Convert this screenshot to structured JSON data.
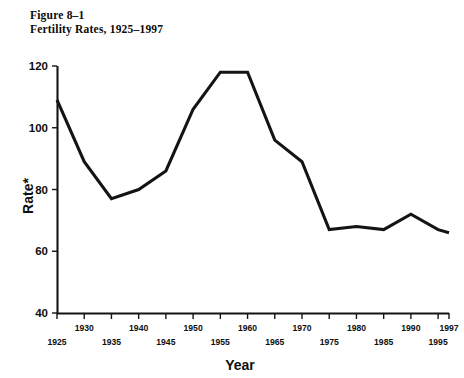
{
  "figure": {
    "label": "Figure 8–1",
    "caption": "Fertility Rates, 1925–1997"
  },
  "chart_data": {
    "type": "line",
    "title": "Fertility Rates, 1925–1997",
    "xlabel": "Year",
    "ylabel": "Rate*",
    "xlim": [
      1925,
      1997
    ],
    "ylim": [
      40,
      120
    ],
    "ytick_labels": [
      "40",
      "60",
      "80",
      "100",
      "120"
    ],
    "yticks": [
      40,
      60,
      80,
      100,
      120
    ],
    "xticks": [
      1925,
      1930,
      1935,
      1940,
      1945,
      1950,
      1955,
      1960,
      1965,
      1970,
      1975,
      1980,
      1985,
      1990,
      1995,
      1997
    ],
    "xtick_labels_upper": [
      "1930",
      "1940",
      "1950",
      "1960",
      "1970",
      "1980",
      "1990",
      "1997"
    ],
    "xtick_labels_lower": [
      "1925",
      "1935",
      "1945",
      "1955",
      "1965",
      "1975",
      "1985",
      "1995"
    ],
    "grid": false,
    "legend": null,
    "line_color": "#141414",
    "x": [
      1925,
      1930,
      1935,
      1940,
      1945,
      1950,
      1955,
      1960,
      1965,
      1970,
      1975,
      1980,
      1985,
      1990,
      1995,
      1997
    ],
    "values": [
      109,
      89,
      77,
      80,
      86,
      106,
      118,
      118,
      96,
      89,
      67,
      68,
      67,
      72,
      67,
      66
    ],
    "series": [
      {
        "name": "Fertility Rate",
        "values": [
          109,
          89,
          77,
          80,
          86,
          106,
          118,
          118,
          96,
          89,
          67,
          68,
          67,
          72,
          67,
          66
        ]
      }
    ]
  }
}
